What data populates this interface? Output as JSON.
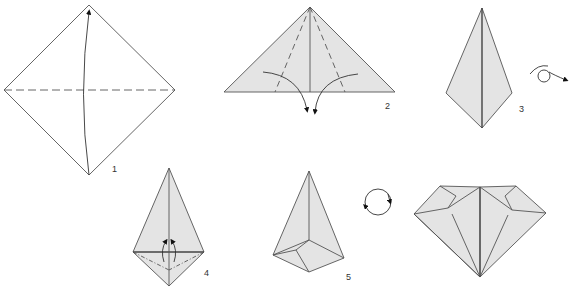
{
  "colors": {
    "paper": "#e4e4e4",
    "line": "#555555",
    "background": "#ffffff"
  },
  "steps": [
    {
      "number": "1",
      "description": "Square diamond with horizontal dashed valley fold; fold bottom up to top"
    },
    {
      "number": "2",
      "description": "Triangle with two dashed folds; fold bottom edges down"
    },
    {
      "number": "3",
      "description": "Kite shape; turn over"
    },
    {
      "number": "4",
      "description": "Kite with bottom flaps; fold up"
    },
    {
      "number": "5",
      "description": "Folded pocket shape; rotate"
    },
    {
      "number": "",
      "description": "Finished diamond"
    }
  ],
  "symbols": {
    "turn_over": "turn-over-icon",
    "rotate": "rotate-icon"
  }
}
